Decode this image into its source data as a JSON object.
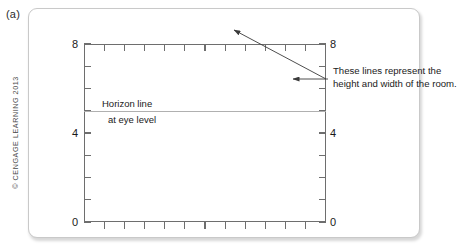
{
  "figure": {
    "panel_label": "(a)",
    "copyright": "© CENGAGE LEARNING 2013"
  },
  "annotation": {
    "line1": "These lines represent the",
    "line2": "height and width of the room."
  },
  "horizon": {
    "line1": "Horizon line",
    "line2": "at eye level",
    "value": 5
  },
  "colors": {
    "axis": "#6e6e6e",
    "horizon": "#b0b0b0",
    "leader": "#3a3a3a",
    "panel_border": "#c9c9c9",
    "text": "#1a1a1a"
  },
  "chart_data": {
    "type": "line",
    "title": "",
    "subtitle": "",
    "xlabel": "",
    "ylabel": "",
    "xlim": [
      0,
      12
    ],
    "ylim": [
      0,
      8
    ],
    "grid": false,
    "legend": null,
    "left_axis": {
      "ticks": [
        0,
        1,
        2,
        3,
        4,
        5,
        6,
        7,
        8
      ],
      "labeled_ticks": [
        {
          "value": 8,
          "label": "8"
        },
        {
          "value": 4,
          "label": "4"
        },
        {
          "value": 0,
          "label": "0"
        }
      ]
    },
    "right_axis": {
      "ticks": [
        0,
        1,
        2,
        3,
        4,
        5,
        6,
        7,
        8
      ],
      "labeled_ticks": [
        {
          "value": 8,
          "label": "8"
        },
        {
          "value": 4,
          "label": "4"
        },
        {
          "value": 0,
          "label": "0"
        }
      ]
    },
    "top_axis": {
      "ticks": [
        0,
        1,
        2,
        3,
        4,
        5,
        6,
        7,
        8,
        9,
        10,
        11,
        12
      ],
      "labeled_ticks": []
    },
    "bottom_axis": {
      "ticks": [
        0,
        1,
        2,
        3,
        4,
        5,
        6,
        7,
        8,
        9,
        10,
        11,
        12
      ],
      "labeled_ticks": []
    },
    "series": [
      {
        "name": "Horizon line at eye level",
        "type": "horizontal-rule",
        "y": 5,
        "x": [
          0,
          12
        ]
      }
    ],
    "annotations": [
      {
        "text": "These lines represent the height and width of the room.",
        "targets": [
          "top-axis",
          "right-axis"
        ]
      },
      {
        "text": "Horizon line at eye level",
        "targets": [
          "horizon-line"
        ]
      }
    ]
  }
}
